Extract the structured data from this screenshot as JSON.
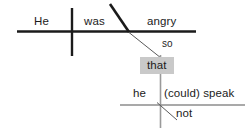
{
  "diagram": {
    "type": "reed-kellogg-sentence-diagram",
    "sentence": "He was so angry that he could not speak",
    "colors": {
      "main_line": "#1b1b1b",
      "sub_line": "#8c8c8c",
      "text": "#1b1b1b",
      "highlight_background": "#c9c9c9",
      "page_background": "#ffffff"
    },
    "main_clause": {
      "subject": "He",
      "verb": "was",
      "predicate_adjective": "angry"
    },
    "connectors": {
      "modifier": "so",
      "subordinating_conjunction": "that"
    },
    "subordinate_clause": {
      "subject": "he",
      "verb": "(could) speak",
      "adverb": "not"
    },
    "labels": {
      "he": "He",
      "was": "was",
      "angry": "angry",
      "so": "so",
      "that": "that",
      "he_lower": "he",
      "could_speak": "(could) speak",
      "not": "not"
    }
  }
}
